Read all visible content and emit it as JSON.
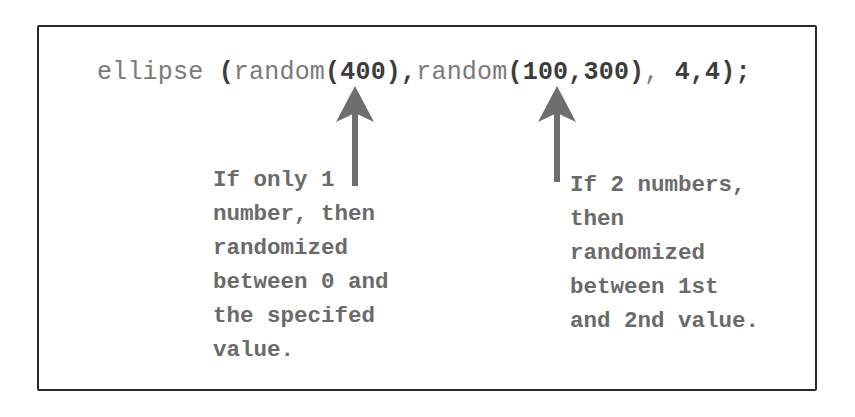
{
  "diagram": {
    "code_line": {
      "segments": [
        {
          "text": "ellipse ",
          "style": "light"
        },
        {
          "text": "(",
          "style": "dark"
        },
        {
          "text": "random",
          "style": "light"
        },
        {
          "text": "(400)",
          "style": "dark"
        },
        {
          "text": ",",
          "style": "dark"
        },
        {
          "text": "random",
          "style": "light"
        },
        {
          "text": "(100,300)",
          "style": "dark"
        },
        {
          "text": ", ",
          "style": "light"
        },
        {
          "text": "4,4);",
          "style": "dark"
        }
      ]
    },
    "annotations": [
      {
        "id": "single-argument-note",
        "points_to": "random(400)",
        "lines": [
          "If only 1",
          "number, then",
          "randomized",
          "between 0 and",
          "the specifed",
          "value."
        ]
      },
      {
        "id": "two-argument-note",
        "points_to": "random(100,300)",
        "lines": [
          "If 2 numbers,",
          "then",
          "randomized",
          "between 1st",
          "and 2nd value."
        ]
      }
    ],
    "arrows": [
      {
        "name": "arrow-to-random-400",
        "direction": "up"
      },
      {
        "name": "arrow-to-random-100-300",
        "direction": "up"
      }
    ],
    "colors": {
      "border": "#2a2a2a",
      "code_light": "#7a7a7a",
      "code_dark": "#3c3c3c",
      "note_text": "#6a6a6a",
      "arrow": "#6e6e6e"
    }
  }
}
